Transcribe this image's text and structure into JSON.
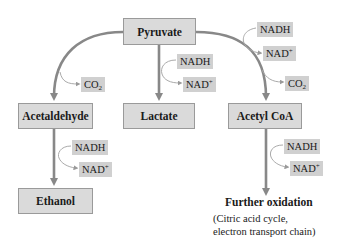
{
  "diagram": {
    "type": "metabolic-pathway",
    "colors": {
      "node_fill": "#dadada",
      "node_border": "#9a9a9a",
      "pill_fill": "#d0d0d0",
      "arrow": "#888888"
    },
    "nodes": {
      "pyruvate": "Pyruvate",
      "acetaldehyde": "Acetaldehyde",
      "lactate": "Lactate",
      "acetyl_coa": "Acetyl CoA",
      "ethanol": "Ethanol"
    },
    "cofactors": {
      "nadh": "NADH",
      "nad_base": "NAD",
      "nad_sup": "+",
      "co2_base": "CO",
      "co2_sub": "2"
    },
    "further": {
      "title": "Further oxidation",
      "note_line1": "(Citric acid cycle,",
      "note_line2": "electron transport chain)"
    },
    "edges": [
      {
        "from": "Pyruvate",
        "to": "Acetaldehyde",
        "releases": [
          "CO2"
        ]
      },
      {
        "from": "Pyruvate",
        "to": "Lactate",
        "consumes": "NADH",
        "produces": "NAD+"
      },
      {
        "from": "Pyruvate",
        "to": "Acetyl CoA",
        "consumes": "NADH",
        "produces": "NAD+",
        "releases": [
          "CO2"
        ]
      },
      {
        "from": "Acetaldehyde",
        "to": "Ethanol",
        "consumes": "NADH",
        "produces": "NAD+"
      },
      {
        "from": "Acetyl CoA",
        "to": "Further oxidation",
        "consumes": "NADH",
        "produces": "NAD+"
      }
    ]
  }
}
